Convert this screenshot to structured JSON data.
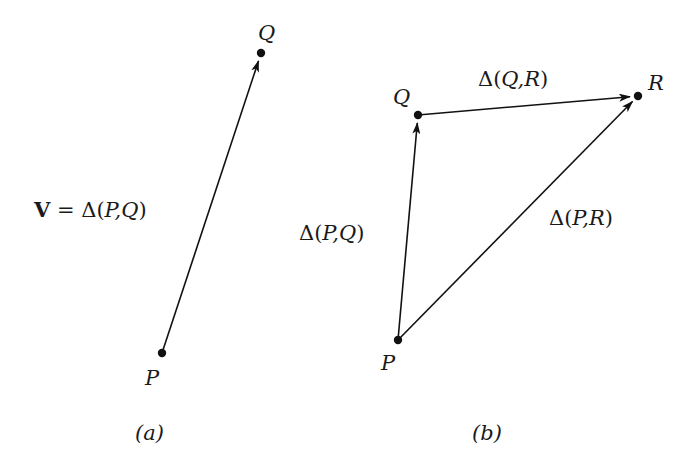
{
  "figure_a": {
    "caption": "(a)",
    "points": {
      "P": {
        "label": "P",
        "x": 162,
        "y": 353
      },
      "Q": {
        "label": "Q",
        "x": 261,
        "y": 53
      }
    },
    "vectors": [
      {
        "from": "P",
        "to": "Q",
        "label_bold": "V",
        "label_eq": " = ",
        "label_delta": "Δ(",
        "label_args": "P,Q",
        "label_close": ")"
      }
    ]
  },
  "figure_b": {
    "caption": "(b)",
    "points": {
      "P": {
        "label": "P",
        "x": 398,
        "y": 340
      },
      "Q": {
        "label": "Q",
        "x": 418,
        "y": 115
      },
      "R": {
        "label": "R",
        "x": 638,
        "y": 96
      }
    },
    "vectors": [
      {
        "from": "P",
        "to": "Q",
        "label_delta": "Δ(",
        "label_args": "P,Q",
        "label_close": ")"
      },
      {
        "from": "Q",
        "to": "R",
        "label_delta": "Δ(",
        "label_args": "Q,R",
        "label_close": ")"
      },
      {
        "from": "P",
        "to": "R",
        "label_delta": "Δ(",
        "label_args": "P,R",
        "label_close": ")"
      }
    ]
  },
  "colors": {
    "ink": "#111111",
    "background": "#ffffff"
  }
}
